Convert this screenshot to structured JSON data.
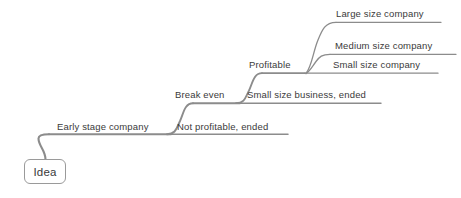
{
  "diagram": {
    "type": "mind-map",
    "title": "Idea",
    "canvas": {
      "width": 461,
      "height": 198
    },
    "colors": {
      "background": "#ffffff",
      "branch_line": "#8c8c8c",
      "text": "#3a3a3a",
      "node_border": "#9a9a9a",
      "node_fill": "#ffffff"
    },
    "root": {
      "label": "Idea",
      "x": 24,
      "y": 159,
      "width": 42,
      "height": 25
    },
    "branches": [
      {
        "id": "early-stage-company",
        "label": "Early stage company",
        "level": 1,
        "text_x": 57,
        "text_y": 121,
        "line_y": 134,
        "line_x1": 49,
        "line_x2": 171
      },
      {
        "id": "not-profitable-ended",
        "label": "Not profitable, ended",
        "level": 2,
        "text_x": 177,
        "text_y": 121,
        "line_y": 134,
        "line_x1": 171,
        "line_x2": 288
      },
      {
        "id": "break-even",
        "label": "Break even",
        "level": 2,
        "text_x": 175,
        "text_y": 89,
        "line_y": 103,
        "line_x1": 167,
        "line_x2": 240
      },
      {
        "id": "small-size-business-ended",
        "label": "Small size business, ended",
        "level": 3,
        "text_x": 247,
        "text_y": 89,
        "line_y": 103,
        "line_x1": 240,
        "line_x2": 381
      },
      {
        "id": "profitable",
        "label": "Profitable",
        "level": 3,
        "text_x": 249,
        "text_y": 59,
        "line_y": 73,
        "line_x1": 240,
        "line_x2": 305
      },
      {
        "id": "small-size-company",
        "label": "Small size company",
        "level": 4,
        "text_x": 333,
        "text_y": 59,
        "line_y": 73,
        "line_x1": 305,
        "line_x2": 438
      },
      {
        "id": "medium-size-company",
        "label": "Medium size company",
        "level": 4,
        "text_x": 335,
        "text_y": 40,
        "line_y": 54,
        "line_x1": 323,
        "line_x2": 456
      },
      {
        "id": "large-size-company",
        "label": "Large size company",
        "level": 4,
        "text_x": 336,
        "text_y": 8,
        "line_y": 22,
        "line_x1": 329,
        "line_x2": 441
      }
    ],
    "connectors": [
      {
        "id": "root-to-early-stage",
        "from": "Idea",
        "to": "Early stage company"
      },
      {
        "id": "early-stage-to-not-profitable",
        "from": "Early stage company",
        "to": "Not profitable, ended"
      },
      {
        "id": "early-stage-to-break-even",
        "from": "Early stage company",
        "to": "Break even"
      },
      {
        "id": "break-even-to-small-size-business",
        "from": "Break even",
        "to": "Small size business, ended"
      },
      {
        "id": "break-even-to-profitable",
        "from": "Break even",
        "to": "Profitable"
      },
      {
        "id": "profitable-to-small-size-company",
        "from": "Profitable",
        "to": "Small size company"
      },
      {
        "id": "profitable-to-medium-size-company",
        "from": "Profitable",
        "to": "Medium size company"
      },
      {
        "id": "profitable-to-large-size-company",
        "from": "Profitable",
        "to": "Large size company"
      }
    ]
  }
}
